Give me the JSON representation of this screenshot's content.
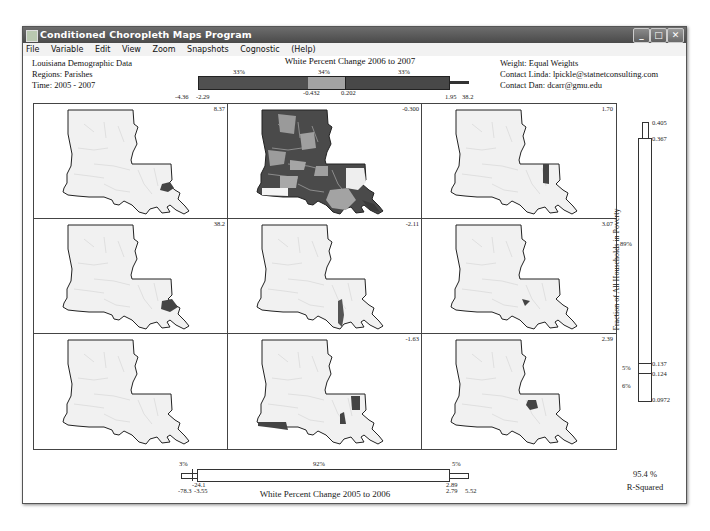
{
  "window": {
    "title": "Conditioned Choropleth Maps Program",
    "controls": {
      "minimize": "_",
      "maximize": "□",
      "close": "✕"
    }
  },
  "menu": [
    "File",
    "Variable",
    "Edit",
    "View",
    "Zoom",
    "Snapshots",
    "Cognostic",
    "(Help)"
  ],
  "info_left": {
    "dataset": "Louisiana Demographic Data",
    "regions": "Regions:  Parishes",
    "time": "Time:  2005 - 2007"
  },
  "info_right": {
    "weight": "Weight: Equal Weights",
    "contact_linda": "Contact Linda: lpickle@statnetconsulting.com",
    "contact_dan": "Contact Dan:  dcarr@gmu.edu"
  },
  "top_slider": {
    "title": "White Percent Change 2006 to 2007",
    "percents": [
      "33%",
      "34%",
      "33%"
    ],
    "labels": {
      "min": "-4.36",
      "low": "-2.29",
      "mid1": "-0.432",
      "mid2": "0.202",
      "high": "1.95",
      "max": "38.2"
    },
    "colors": {
      "low": "#505050",
      "mid": "#a3a3a3",
      "high": "#484848"
    }
  },
  "right_slider": {
    "title": "Fraction of All Households in Poverty",
    "percents": [
      "89%",
      "5%",
      "6%"
    ],
    "labels": {
      "max": "0.405",
      "high": "0.367",
      "mid1": "0.137",
      "mid2": "0.124",
      "min": "0.0972"
    }
  },
  "bottom_slider": {
    "title": "White Percent  Change 2005 to 2006",
    "percents": [
      "3%",
      "92%",
      "5%"
    ],
    "labels": {
      "min": "-78.3",
      "low": "-3.55",
      "low_top": "-24.1",
      "high_top": "2.89",
      "high": "2.79",
      "max": "5.52"
    }
  },
  "r_squared": {
    "value": "95.4 %",
    "label": "R-Squared"
  },
  "panels": [
    {
      "row": 0,
      "col": 0,
      "value": "8.37",
      "highlight": "east"
    },
    {
      "row": 0,
      "col": 1,
      "value": "-0.300",
      "highlight": "full"
    },
    {
      "row": 0,
      "col": 2,
      "value": "1.70",
      "highlight": "northeast-strip"
    },
    {
      "row": 1,
      "col": 0,
      "value": "38.2",
      "highlight": "east-coast"
    },
    {
      "row": 1,
      "col": 1,
      "value": "-2.11",
      "highlight": "south-strip"
    },
    {
      "row": 1,
      "col": 2,
      "value": "3.07",
      "highlight": "center"
    },
    {
      "row": 2,
      "col": 0,
      "value": "",
      "highlight": "none"
    },
    {
      "row": 2,
      "col": 1,
      "value": "-1.63",
      "highlight": "southwest-east"
    },
    {
      "row": 2,
      "col": 2,
      "value": "2.39",
      "highlight": "center-east"
    }
  ]
}
